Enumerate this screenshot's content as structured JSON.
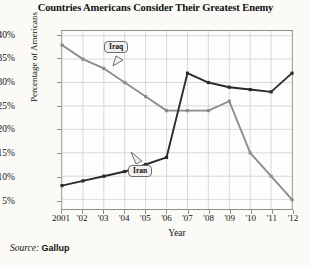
{
  "title": "Countries Americans Consider Their Greatest Enemy",
  "source": {
    "label": "Source:",
    "value": "Gallup"
  },
  "axes": {
    "xlabel": "Year",
    "ylabel": "Percentage of Americans",
    "yticks": [
      "5%",
      "10%",
      "15%",
      "20%",
      "25%",
      "30%",
      "35%",
      "40%"
    ],
    "xticks": [
      "2001",
      "'02",
      "'03",
      "'04",
      "'05",
      "'06",
      "'07",
      "'08",
      "'09",
      "'10",
      "'11",
      "'12"
    ]
  },
  "annotations": {
    "iraq_label": "Iraq",
    "iran_label": "Iran"
  },
  "colors": {
    "iran_line": "#2b2b2b",
    "iraq_line": "#8c8c8c",
    "grid": "#cfcfcf",
    "frame": "#8e8e8e",
    "background": "#fbfaf7"
  },
  "chart_data": {
    "type": "line",
    "title": "Countries Americans Consider Their Greatest Enemy",
    "xlabel": "Year",
    "ylabel": "Percentage of Americans",
    "x": [
      2001,
      2002,
      2003,
      2004,
      2005,
      2006,
      2007,
      2008,
      2009,
      2010,
      2011,
      2012
    ],
    "xtick_labels": [
      "2001",
      "'02",
      "'03",
      "'04",
      "'05",
      "'06",
      "'07",
      "'08",
      "'09",
      "'10",
      "'11",
      "'12"
    ],
    "xlim": [
      2001,
      2012
    ],
    "ylim": [
      3,
      41
    ],
    "ytick_values": [
      5,
      10,
      15,
      20,
      25,
      30,
      35,
      40
    ],
    "grid": true,
    "legend": "inline-callouts",
    "series": [
      {
        "name": "Iraq",
        "color": "#8c8c8c",
        "values": [
          38,
          35,
          33,
          30,
          27,
          24,
          24,
          24,
          26,
          15,
          10,
          7
        ]
      },
      {
        "name": "Iran",
        "color": "#2b2b2b",
        "values": [
          8,
          9,
          10,
          11,
          12.5,
          14,
          32,
          30,
          29,
          28.5,
          28,
          27
        ]
      }
    ],
    "series_note": {
      "iraq_end_2012": 5,
      "iran_end_2012": 32
    }
  }
}
